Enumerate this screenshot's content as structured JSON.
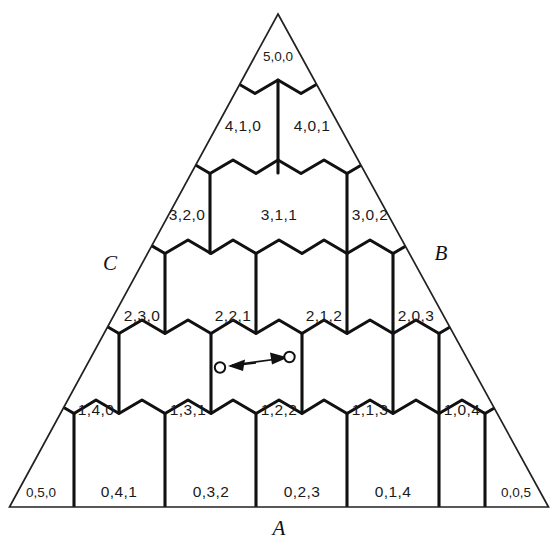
{
  "figure": {
    "type": "ternary-hexagonal-composition-diagram",
    "vertices": {
      "apex_label": "A_top_none",
      "a": "A",
      "b": "B",
      "c": "C"
    },
    "colors": {
      "ink": "#111111",
      "cell_stroke": "#111111",
      "triangle_stroke": "#222222",
      "background": "#ffffff"
    },
    "rows": [
      {
        "index": 0,
        "cells": [
          {
            "id": "5-0-0",
            "label": "5,0,0",
            "a": 5,
            "b": 0,
            "c": 0,
            "size": "small"
          }
        ]
      },
      {
        "index": 1,
        "cells": [
          {
            "id": "4-1-0",
            "label": "4,1,0",
            "a": 4,
            "b": 1,
            "c": 0,
            "size": "normal"
          },
          {
            "id": "4-0-1",
            "label": "4,0,1",
            "a": 4,
            "b": 0,
            "c": 1,
            "size": "normal"
          }
        ]
      },
      {
        "index": 2,
        "cells": [
          {
            "id": "3-2-0",
            "label": "3,2,0",
            "a": 3,
            "b": 2,
            "c": 0,
            "size": "normal"
          },
          {
            "id": "3-1-1",
            "label": "3,1,1",
            "a": 3,
            "b": 1,
            "c": 1,
            "size": "normal"
          },
          {
            "id": "3-0-2",
            "label": "3,0,2",
            "a": 3,
            "b": 0,
            "c": 2,
            "size": "normal"
          }
        ]
      },
      {
        "index": 3,
        "cells": [
          {
            "id": "2-3-0",
            "label": "2,3,0",
            "a": 2,
            "b": 3,
            "c": 0,
            "size": "normal"
          },
          {
            "id": "2-2-1",
            "label": "2,2,1",
            "a": 2,
            "b": 2,
            "c": 1,
            "size": "normal"
          },
          {
            "id": "2-1-2",
            "label": "2,1,2",
            "a": 2,
            "b": 1,
            "c": 2,
            "size": "normal"
          },
          {
            "id": "2-0-3",
            "label": "2,0,3",
            "a": 2,
            "b": 0,
            "c": 3,
            "size": "normal"
          }
        ]
      },
      {
        "index": 4,
        "cells": [
          {
            "id": "1-4-0",
            "label": "1,4,0",
            "a": 1,
            "b": 4,
            "c": 0,
            "size": "normal"
          },
          {
            "id": "1-3-1",
            "label": "1,3,1",
            "a": 1,
            "b": 3,
            "c": 1,
            "size": "normal"
          },
          {
            "id": "1-2-2",
            "label": "1,2,2",
            "a": 1,
            "b": 2,
            "c": 2,
            "size": "normal"
          },
          {
            "id": "1-1-3",
            "label": "1,1,3",
            "a": 1,
            "b": 1,
            "c": 3,
            "size": "normal"
          },
          {
            "id": "1-0-4",
            "label": "1,0,4",
            "a": 1,
            "b": 0,
            "c": 4,
            "size": "normal"
          }
        ]
      },
      {
        "index": 5,
        "cells": [
          {
            "id": "0-5-0",
            "label": "0,5,0",
            "a": 0,
            "b": 5,
            "c": 0,
            "size": "small"
          },
          {
            "id": "0-4-1",
            "label": "0,4,1",
            "a": 0,
            "b": 4,
            "c": 1,
            "size": "normal"
          },
          {
            "id": "0-3-2",
            "label": "0,3,2",
            "a": 0,
            "b": 3,
            "c": 2,
            "size": "normal"
          },
          {
            "id": "0-2-3",
            "label": "0,2,3",
            "a": 0,
            "b": 2,
            "c": 3,
            "size": "normal"
          },
          {
            "id": "0-1-4",
            "label": "0,1,4",
            "a": 0,
            "b": 1,
            "c": 4,
            "size": "normal"
          },
          {
            "id": "0-0-5",
            "label": "0,0,5",
            "a": 0,
            "b": 0,
            "c": 5,
            "size": "small"
          }
        ]
      }
    ],
    "annotation": {
      "name": "transition-arrow-pair",
      "description": "two small open circles joined by opposing arrowheads near the 2,2,1 / 1,2,2 boundary"
    }
  }
}
